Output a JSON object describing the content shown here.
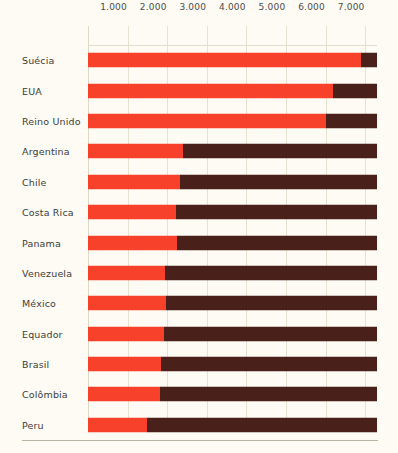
{
  "chart_data": {
    "type": "bar",
    "orientation": "horizontal",
    "stacked": true,
    "title": "",
    "subtitle": "",
    "xlabel": "",
    "ylabel": "",
    "xlim": [
      0,
      7300
    ],
    "grid": true,
    "legend_position": "none",
    "tick_labels": [
      "1.000",
      "2.000",
      "3.000",
      "4.000",
      "5.000",
      "6.000",
      "7.000"
    ],
    "tick_values": [
      1000,
      2000,
      3000,
      4000,
      5000,
      6000,
      7000
    ],
    "categories": [
      "Suécia",
      "EUA",
      "Reino Unido",
      "Argentina",
      "Chile",
      "Costa Rica",
      "Panama",
      "Venezuela",
      "México",
      "Equador",
      "Brasil",
      "Colômbia",
      "Peru"
    ],
    "series": [
      {
        "name": "segmento-vermelho",
        "color": "#f8412b",
        "values": [
          6900,
          6200,
          6000,
          2400,
          2320,
          2230,
          2250,
          1950,
          1970,
          1920,
          1850,
          1820,
          1500
        ]
      },
      {
        "name": "segmento-escuro",
        "color": "#4a211a",
        "values": [
          400,
          1100,
          1300,
          4900,
          4980,
          5070,
          5050,
          5350,
          5330,
          5380,
          5450,
          5480,
          5800
        ]
      }
    ],
    "totals": [
      7300,
      7300,
      7300,
      7300,
      7300,
      7300,
      7300,
      7300,
      7300,
      7300,
      7300,
      7300,
      7300
    ]
  },
  "colors": {
    "accent_red": "#f8412b",
    "accent_dark": "#4a211a",
    "background": "#fdfbf3",
    "gridline": "#e6e1d0",
    "text": "#3c3c3c"
  }
}
